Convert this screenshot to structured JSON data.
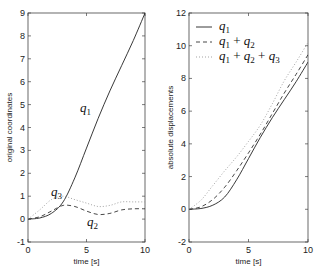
{
  "chart_data": [
    {
      "type": "line",
      "title": "",
      "xlabel": "time [s]",
      "ylabel": "original coordinates",
      "xlim": [
        0,
        10
      ],
      "ylim": [
        -1,
        9
      ],
      "xticks": [
        0,
        5,
        10
      ],
      "yticks": [
        -1,
        0,
        1,
        2,
        3,
        4,
        5,
        6,
        7,
        8,
        9
      ],
      "grid": false,
      "annotations": [
        "q1",
        "q2",
        "q3"
      ],
      "x": [
        0,
        1,
        2,
        3,
        4,
        5,
        6,
        7,
        8,
        9,
        10
      ],
      "series": [
        {
          "name": "q1",
          "style": "solid",
          "values": [
            0,
            0.05,
            0.25,
            0.75,
            1.8,
            3.1,
            4.4,
            5.6,
            6.7,
            7.8,
            9.0
          ]
        },
        {
          "name": "q2",
          "style": "dashed",
          "values": [
            0,
            0.1,
            0.35,
            0.6,
            0.55,
            0.35,
            0.2,
            0.25,
            0.4,
            0.45,
            0.45
          ]
        },
        {
          "name": "q3",
          "style": "dotted",
          "values": [
            0,
            0.4,
            0.85,
            1.0,
            0.85,
            0.7,
            0.55,
            0.6,
            0.75,
            0.75,
            0.75
          ]
        }
      ]
    },
    {
      "type": "line",
      "title": "",
      "xlabel": "time [s]",
      "ylabel": "absolute displacements",
      "xlim": [
        0,
        10
      ],
      "ylim": [
        -2,
        12
      ],
      "xticks": [
        0,
        5,
        10
      ],
      "yticks": [
        -2,
        0,
        2,
        4,
        6,
        8,
        10,
        12
      ],
      "grid": false,
      "legend": {
        "position": "upper left",
        "entries": [
          "q1",
          "q1 + q2",
          "q1 + q2 + q3"
        ]
      },
      "x": [
        0,
        1,
        2,
        3,
        4,
        5,
        6,
        7,
        8,
        9,
        10
      ],
      "series": [
        {
          "name": "q1",
          "style": "solid",
          "values": [
            0,
            0.05,
            0.25,
            0.75,
            1.8,
            3.1,
            4.4,
            5.6,
            6.7,
            7.8,
            9.0
          ]
        },
        {
          "name": "q1 + q2",
          "style": "dashed",
          "values": [
            0,
            0.15,
            0.6,
            1.35,
            2.35,
            3.45,
            4.6,
            5.85,
            7.1,
            8.25,
            9.45
          ]
        },
        {
          "name": "q1 + q2 + q3",
          "style": "dotted",
          "values": [
            0,
            0.55,
            1.45,
            2.35,
            3.2,
            4.15,
            5.15,
            6.45,
            7.85,
            9.0,
            10.2
          ]
        }
      ]
    }
  ],
  "left": {
    "ylabel": "original coordinates",
    "xlabel": "time [s]",
    "yticks": [
      "-1",
      "0",
      "1",
      "2",
      "3",
      "4",
      "5",
      "6",
      "7",
      "8",
      "9"
    ],
    "xticks": [
      "0",
      "5",
      "10"
    ],
    "ann_q1": {
      "base": "q",
      "sub": "1"
    },
    "ann_q2": {
      "base": "q",
      "sub": "2"
    },
    "ann_q3": {
      "base": "q",
      "sub": "3"
    }
  },
  "right": {
    "ylabel": "absolute displacements",
    "xlabel": "time [s]",
    "yticks": [
      "-2",
      "0",
      "2",
      "4",
      "6",
      "8",
      "10",
      "12"
    ],
    "xticks": [
      "0",
      "5",
      "10"
    ],
    "legend": [
      {
        "base": "q",
        "sub": "1",
        "rest": ""
      },
      {
        "base": "q",
        "sub": "1",
        "rest": "+ q2"
      },
      {
        "base": "q",
        "sub": "1",
        "rest": "+ q2 + q3"
      }
    ]
  }
}
